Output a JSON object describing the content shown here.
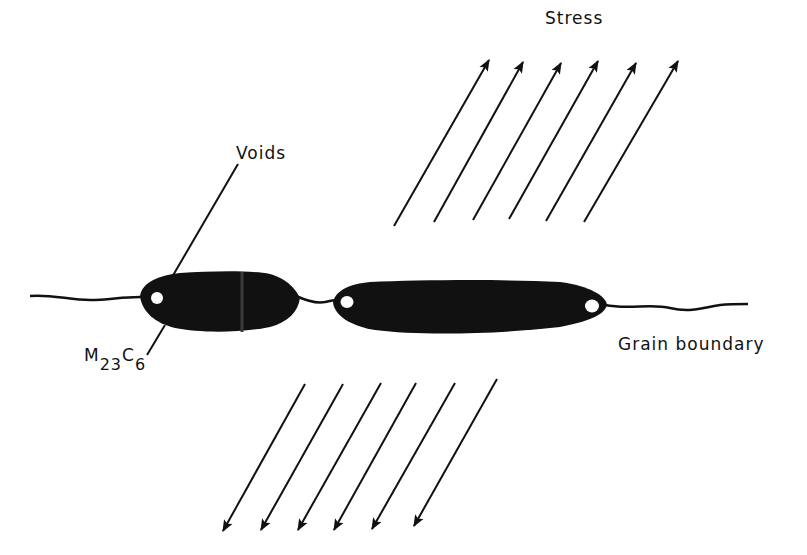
{
  "diagram": {
    "labels": {
      "stress": "Stress",
      "voids": "Voids",
      "grain_boundary": "Grain boundary",
      "carbide_M": "M",
      "carbide_sub1": "23",
      "carbide_C": "C",
      "carbide_sub2": "6"
    },
    "stress_arrows_top_count": 6,
    "stress_arrows_bottom_count": 6,
    "precipitates": 2,
    "voids_count": 3,
    "colors": {
      "ink": "#111111",
      "background": "#ffffff"
    }
  }
}
